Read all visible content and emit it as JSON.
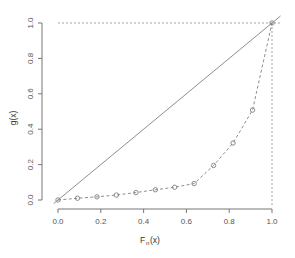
{
  "chart_data": {
    "type": "line",
    "title": "",
    "subtitle": "",
    "xlabel": "Fₙ(x)",
    "xlabel_base": "F",
    "xlabel_sub": "n",
    "xlabel_tail": "(x)",
    "ylabel": "g(x)",
    "xlim": [
      0.0,
      1.0
    ],
    "ylim": [
      0.0,
      1.0
    ],
    "grid": false,
    "legend": "none",
    "x_ticks": [
      "0.0",
      "0.2",
      "0.4",
      "0.6",
      "0.8",
      "1.0"
    ],
    "x_tick_values": [
      0.0,
      0.2,
      0.4,
      0.6,
      0.8,
      1.0
    ],
    "y_ticks": [
      "0.0",
      "0.2",
      "0.4",
      "0.6",
      "0.8",
      "1.0"
    ],
    "y_tick_values": [
      0.0,
      0.2,
      0.4,
      0.6,
      0.8,
      1.0
    ],
    "series": [
      {
        "name": "g(x) curve",
        "style": "dashed-with-open-circle-markers",
        "color": "#808080",
        "marker": "open-circle",
        "x": [
          0.0,
          0.091,
          0.182,
          0.273,
          0.364,
          0.455,
          0.545,
          0.636,
          0.727,
          0.818,
          0.909,
          1.0
        ],
        "y": [
          0.0,
          0.01,
          0.018,
          0.028,
          0.042,
          0.058,
          0.072,
          0.093,
          0.195,
          0.322,
          0.508,
          1.0
        ]
      },
      {
        "name": "diagonal reference line",
        "style": "solid",
        "color": "#808080",
        "marker": "none",
        "x": [
          -0.02,
          1.04
        ],
        "y": [
          -0.02,
          1.04
        ]
      }
    ],
    "annotations": [
      {
        "name": "horizontal-guide",
        "style": "dashed",
        "color": "#999999",
        "from": [
          0.0,
          1.0
        ],
        "to": [
          1.0,
          1.0
        ]
      },
      {
        "name": "vertical-guide",
        "style": "dashed",
        "color": "#999999",
        "from": [
          1.0,
          0.0
        ],
        "to": [
          1.0,
          1.0
        ]
      }
    ],
    "colors": {
      "axis": "#777777",
      "curve": "#808080",
      "reference_line": "#808080",
      "guide_line": "#999999",
      "background": "#ffffff",
      "tick_label": "#555555"
    }
  }
}
